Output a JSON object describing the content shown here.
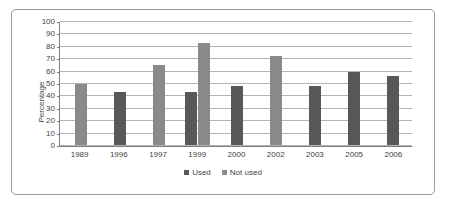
{
  "chart_data": {
    "type": "bar",
    "title": "",
    "xlabel": "",
    "ylabel": "Percentage",
    "ylim": [
      0,
      100
    ],
    "ytick_step": 10,
    "ytick_labels": [
      "100",
      "90",
      "80",
      "70",
      "60",
      "50",
      "40",
      "30",
      "20",
      "10",
      "0"
    ],
    "grid": true,
    "legend_position": "bottom",
    "categories": [
      "1989",
      "1996",
      "1997",
      "1999",
      "2000",
      "2002",
      "2003",
      "2005",
      "2006"
    ],
    "series": [
      {
        "name": "Used",
        "color": "#585858",
        "values": [
          null,
          43,
          null,
          43,
          48,
          null,
          48,
          59,
          56
        ]
      },
      {
        "name": "Not used",
        "color": "#8a8a8a",
        "values": [
          50,
          null,
          65,
          83,
          null,
          72,
          null,
          null,
          null
        ]
      }
    ]
  },
  "legend": {
    "entries": [
      {
        "label": "Used",
        "swatch": "legend-swatch-used"
      },
      {
        "label": "Not used",
        "swatch": "legend-swatch-not-used"
      }
    ]
  },
  "colors": {
    "series_used": "#585858",
    "series_not_used": "#8a8a8a",
    "gridline": "#b4b4b4",
    "axis": "#7d7d7d",
    "frame_border": "#9a9a9a",
    "text": "#3f3f3f",
    "background": "#ffffff"
  }
}
